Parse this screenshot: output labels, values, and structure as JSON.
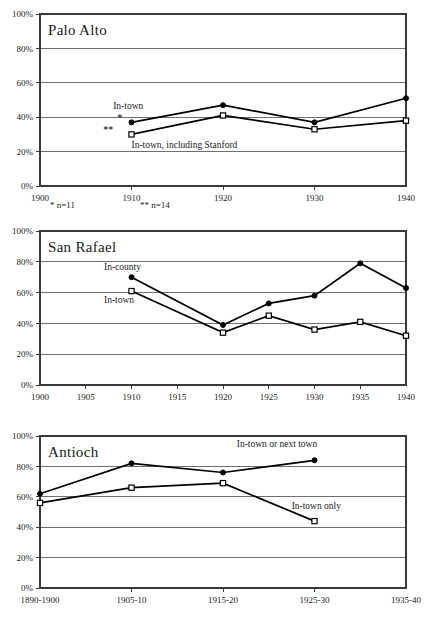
{
  "chart_data": [
    {
      "type": "line",
      "title": "Palo Alto",
      "xlabel": "",
      "ylabel": "",
      "x": [
        1900,
        1910,
        1920,
        1930,
        1940
      ],
      "xticks": [
        "1900",
        "1910",
        "1920",
        "1930",
        "1940"
      ],
      "yticks": [
        "0%",
        "20%",
        "40%",
        "60%",
        "80%",
        "100%"
      ],
      "ylim": [
        0,
        100
      ],
      "xlim": [
        1900,
        1940
      ],
      "grid": true,
      "legend_position": "inline-annotations",
      "series": [
        {
          "name": "In-town",
          "marker": "filled-circle",
          "x": [
            1910,
            1920,
            1930,
            1940
          ],
          "values": [
            37,
            47,
            37,
            51
          ]
        },
        {
          "name": "In-town, including Stanford",
          "marker": "open-square",
          "x": [
            1910,
            1920,
            1930,
            1940
          ],
          "values": [
            30,
            41,
            33,
            38
          ]
        }
      ],
      "annotations": [
        {
          "text": "In-town",
          "x": 1908,
          "y": 45
        },
        {
          "text": "In-town, including Stanford",
          "x": 1910,
          "y": 22
        },
        {
          "text": "*",
          "x": 1909,
          "y": 38
        },
        {
          "text": "**",
          "x": 1908,
          "y": 31
        }
      ],
      "footnotes": [
        "* n=11",
        "** n=14"
      ]
    },
    {
      "type": "line",
      "title": "San Rafael",
      "xlabel": "",
      "ylabel": "",
      "x": [
        1900,
        1905,
        1910,
        1915,
        1920,
        1925,
        1930,
        1935,
        1940
      ],
      "xticks": [
        "1900",
        "1905",
        "1910",
        "1915",
        "1920",
        "1925",
        "1930",
        "1935",
        "1940"
      ],
      "yticks": [
        "0%",
        "20%",
        "40%",
        "60%",
        "80%",
        "100%"
      ],
      "ylim": [
        0,
        100
      ],
      "xlim": [
        1900,
        1940
      ],
      "grid": true,
      "legend_position": "inline-annotations",
      "series": [
        {
          "name": "In-county",
          "marker": "filled-circle",
          "x": [
            1910,
            1920,
            1925,
            1930,
            1935,
            1940
          ],
          "values": [
            70,
            39,
            53,
            58,
            79,
            63
          ]
        },
        {
          "name": "In-town",
          "marker": "open-square",
          "x": [
            1910,
            1920,
            1925,
            1930,
            1935,
            1940
          ],
          "values": [
            61,
            34,
            45,
            36,
            41,
            32
          ]
        }
      ],
      "annotations": [
        {
          "text": "In-county",
          "x": 1907,
          "y": 75
        },
        {
          "text": "In-town",
          "x": 1907,
          "y": 53
        }
      ],
      "footnotes": []
    },
    {
      "type": "line",
      "title": "Antioch",
      "xlabel": "",
      "ylabel": "",
      "x": [
        0,
        1,
        2,
        3,
        4
      ],
      "xticks": [
        "1890-1900",
        "1905-10",
        "1915-20",
        "1925-30",
        "1935-40"
      ],
      "yticks": [
        "0%",
        "20%",
        "40%",
        "60%",
        "80%",
        "100%"
      ],
      "ylim": [
        0,
        100
      ],
      "grid": true,
      "legend_position": "inline-annotations",
      "series": [
        {
          "name": "In-town or next town",
          "marker": "filled-circle",
          "x": [
            0,
            1,
            2,
            3
          ],
          "values": [
            62,
            82,
            76,
            84
          ]
        },
        {
          "name": "In-town only",
          "marker": "open-square",
          "x": [
            0,
            1,
            2,
            3
          ],
          "values": [
            56,
            66,
            69,
            44
          ]
        }
      ],
      "annotations": [
        {
          "text": "In-town or next town",
          "x": 2.15,
          "y": 93
        },
        {
          "text": "In-town only",
          "x": 2.75,
          "y": 52
        }
      ],
      "footnotes": []
    }
  ]
}
